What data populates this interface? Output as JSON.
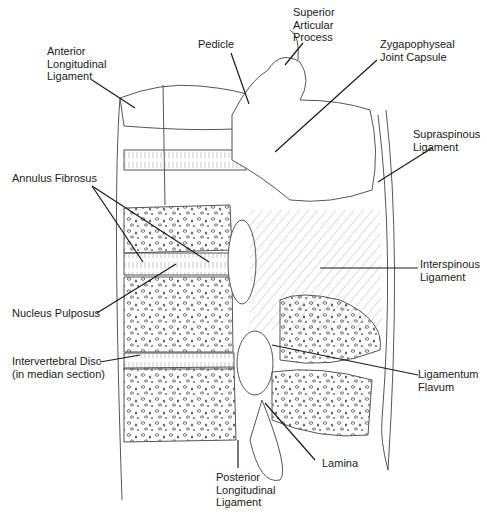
{
  "diagram": {
    "labels": {
      "anterior_longitudinal_ligament": "Anterior\nLongitudinal\nLigament",
      "pedicle": "Pedicle",
      "superior_articular_process": "Superior\nArticular\nProcess",
      "zygapophyseal_joint_capsule": "Zygapophyseal\nJoint Capsule",
      "supraspinous_ligament": "Supraspinous\nLigament",
      "annulus_fibrosus": "Annulus Fibrosus",
      "interspinous_ligament": "Interspinous\nLigament",
      "nucleus_pulposus": "Nucleus Pulposus",
      "intervertebral_disc": "Intervertebral Disc\n(in median section)",
      "ligamentum_flavum": "Ligamentum\nFlavum",
      "lamina": "Lamina",
      "posterior_longitudinal_ligament": "Posterior\nLongitudinal\nLigament"
    },
    "colors": {
      "line": "#1a1a1a",
      "sketch": "#555555",
      "background": "#ffffff"
    }
  }
}
